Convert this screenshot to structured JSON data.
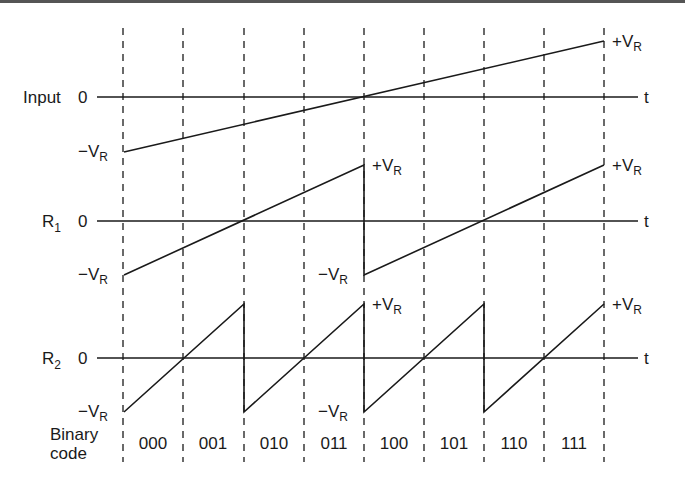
{
  "diagram": {
    "rows": [
      {
        "name": "Input",
        "zero": "0",
        "axis_end": "t",
        "plus": "+V",
        "minus": "−V",
        "sub": "R"
      },
      {
        "name": "R",
        "name_sub": "1",
        "zero": "0",
        "axis_end": "t",
        "plus": "+V",
        "minus": "−V",
        "sub": "R"
      },
      {
        "name": "R",
        "name_sub": "2",
        "zero": "0",
        "axis_end": "t",
        "plus": "+V",
        "minus": "−V",
        "sub": "R"
      }
    ],
    "binary_label_line1": "Binary",
    "binary_label_line2": "code",
    "codes": [
      "000",
      "001",
      "010",
      "011",
      "100",
      "101",
      "110",
      "111"
    ]
  }
}
